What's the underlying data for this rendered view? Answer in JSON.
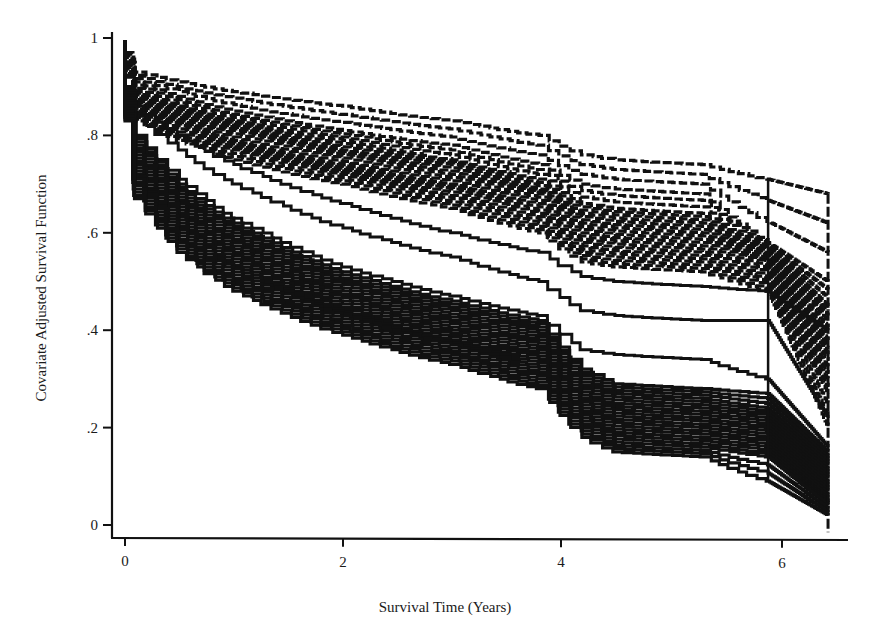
{
  "chart_data": {
    "type": "line",
    "subtype": "step (Kaplan-Meier style survival curves)",
    "title": "",
    "xlabel": "Survival Time (Years)",
    "ylabel": "Covariate Adjusted Survival Function",
    "xlim": [
      0,
      6.5
    ],
    "ylim": [
      0,
      1
    ],
    "x_ticks": [
      0,
      2,
      4,
      6
    ],
    "x_tick_labels": [
      "0",
      "2",
      "4",
      "6"
    ],
    "y_ticks": [
      0,
      0.2,
      0.4,
      0.6,
      0.8,
      1
    ],
    "y_tick_labels": [
      "0",
      ".2",
      ".4",
      ".6",
      ".8",
      "1"
    ],
    "grid": false,
    "legend": null,
    "line_color": "#111111",
    "groups": [
      {
        "name": "upper group (dashed)",
        "style": "dashed",
        "description": "Bundle of ~25 dashed step curves; starts near 0.95 and falls to ~0.55-0.65 by year 5.9, then drops steeply to ~0.2-0.45 at year 6.45",
        "x": [
          0,
          0.1,
          0.5,
          1,
          2,
          3,
          3.8,
          4.2,
          4.5,
          5.3,
          5.9,
          6.45
        ],
        "series": [
          {
            "name": "upper-top",
            "values": [
              0.97,
              0.93,
              0.91,
              0.89,
              0.86,
              0.83,
              0.8,
              0.76,
              0.75,
              0.74,
              0.71,
              0.68
            ]
          },
          {
            "name": "upper-2",
            "values": [
              0.96,
              0.91,
              0.88,
              0.85,
              0.81,
              0.78,
              0.74,
              0.7,
              0.69,
              0.68,
              0.58,
              0.5
            ]
          },
          {
            "name": "upper-3",
            "values": [
              0.95,
              0.89,
              0.86,
              0.83,
              0.79,
              0.75,
              0.71,
              0.66,
              0.65,
              0.64,
              0.57,
              0.45
            ]
          },
          {
            "name": "upper-4",
            "values": [
              0.95,
              0.88,
              0.85,
              0.82,
              0.77,
              0.74,
              0.69,
              0.64,
              0.63,
              0.62,
              0.56,
              0.42
            ]
          },
          {
            "name": "upper-5",
            "values": [
              0.94,
              0.87,
              0.84,
              0.81,
              0.76,
              0.72,
              0.68,
              0.62,
              0.61,
              0.6,
              0.55,
              0.38
            ]
          },
          {
            "name": "upper-6",
            "values": [
              0.94,
              0.86,
              0.83,
              0.79,
              0.74,
              0.7,
              0.66,
              0.6,
              0.59,
              0.58,
              0.54,
              0.35
            ]
          },
          {
            "name": "upper-7",
            "values": [
              0.93,
              0.85,
              0.82,
              0.78,
              0.73,
              0.69,
              0.64,
              0.58,
              0.57,
              0.56,
              0.52,
              0.31
            ]
          },
          {
            "name": "upper-8",
            "values": [
              0.93,
              0.84,
              0.8,
              0.77,
              0.72,
              0.67,
              0.62,
              0.56,
              0.55,
              0.54,
              0.5,
              0.27
            ]
          },
          {
            "name": "upper-bottom",
            "values": [
              0.92,
              0.83,
              0.79,
              0.75,
              0.7,
              0.65,
              0.6,
              0.54,
              0.53,
              0.52,
              0.48,
              0.2
            ]
          }
        ]
      },
      {
        "name": "middle outliers (solid)",
        "style": "solid",
        "x": [
          0,
          0.1,
          0.5,
          1,
          2,
          3,
          3.8,
          4.2,
          4.5,
          5.3,
          5.9,
          6.45
        ],
        "series": [
          {
            "name": "mid-1",
            "values": [
              0.92,
              0.86,
              0.8,
              0.74,
              0.66,
              0.6,
              0.56,
              0.51,
              0.5,
              0.49,
              0.48,
              0.4
            ]
          },
          {
            "name": "mid-2",
            "values": [
              0.9,
              0.84,
              0.77,
              0.7,
              0.61,
              0.55,
              0.5,
              0.44,
              0.43,
              0.42,
              0.42,
              0.22
            ]
          },
          {
            "name": "mid-3",
            "values": [
              0.88,
              0.8,
              0.71,
              0.63,
              0.53,
              0.47,
              0.43,
              0.36,
              0.35,
              0.34,
              0.3,
              0.16
            ]
          }
        ]
      },
      {
        "name": "lower group (solid)",
        "style": "solid",
        "description": "Bundle of ~25 solid step curves; starts near 0.9 and falls to ~0.12-0.28 by year 5.9, then to ~0.02-0.15 at year 6.45",
        "x": [
          0,
          0.1,
          0.5,
          1,
          2,
          3,
          3.8,
          4.2,
          4.5,
          5.3,
          5.9,
          6.45
        ],
        "series": [
          {
            "name": "lower-top",
            "values": [
              0.9,
              0.8,
              0.7,
              0.62,
              0.52,
              0.46,
              0.42,
              0.32,
              0.29,
              0.28,
              0.27,
              0.15
            ]
          },
          {
            "name": "lower-2",
            "values": [
              0.89,
              0.78,
              0.68,
              0.6,
              0.5,
              0.44,
              0.4,
              0.3,
              0.27,
              0.26,
              0.24,
              0.13
            ]
          },
          {
            "name": "lower-3",
            "values": [
              0.88,
              0.76,
              0.66,
              0.58,
              0.48,
              0.42,
              0.38,
              0.28,
              0.25,
              0.24,
              0.22,
              0.11
            ]
          },
          {
            "name": "lower-4",
            "values": [
              0.87,
              0.74,
              0.64,
              0.56,
              0.46,
              0.4,
              0.36,
              0.26,
              0.23,
              0.22,
              0.2,
              0.09
            ]
          },
          {
            "name": "lower-5",
            "values": [
              0.86,
              0.72,
              0.62,
              0.54,
              0.44,
              0.38,
              0.34,
              0.24,
              0.21,
              0.2,
              0.18,
              0.07
            ]
          },
          {
            "name": "lower-6",
            "values": [
              0.85,
              0.71,
              0.6,
              0.52,
              0.43,
              0.37,
              0.32,
              0.22,
              0.19,
              0.18,
              0.16,
              0.05
            ]
          },
          {
            "name": "lower-7",
            "values": [
              0.84,
              0.69,
              0.58,
              0.5,
              0.41,
              0.35,
              0.3,
              0.2,
              0.17,
              0.16,
              0.14,
              0.04
            ]
          },
          {
            "name": "lower-bottom",
            "values": [
              0.83,
              0.67,
              0.56,
              0.48,
              0.39,
              0.33,
              0.28,
              0.18,
              0.15,
              0.14,
              0.09,
              0.02
            ]
          }
        ]
      }
    ]
  }
}
